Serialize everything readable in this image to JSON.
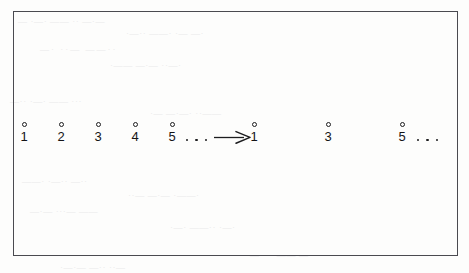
{
  "figure": {
    "type": "number-line-mapping",
    "frame_color": "#4a4a50",
    "ink_color": "#141416",
    "paper_color": "#fdfdfc"
  },
  "left_sequence": {
    "name": "source-sequence",
    "marker": "hollow-circle",
    "labels": [
      "1",
      "2",
      "3",
      "4",
      "5"
    ],
    "trailing_ellipsis_dots": 3
  },
  "arrow": {
    "name": "mapping-arrow",
    "direction": "right",
    "glyph": "arrow-right-icon"
  },
  "right_sequence": {
    "name": "target-sequence",
    "marker": "hollow-circle",
    "labels": [
      "1",
      "3",
      "5"
    ],
    "trailing_ellipsis_dots": 3
  },
  "bleed_through": {
    "note": "illegible show-through text from the reverse page",
    "lines": [
      "— ·—· —— ·· —·—",
      "·—·· ——· ·— —·",
      "—· ··— ——··",
      "·—— —·— ··—·",
      "—·· ·—· —— ···",
      "·— —·—· ··——",
      "——· ·—·· —··",
      "··— —·— ·——·",
      "—·— ···— ——",
      "·—· ——·· ·—·",
      "—··· ·—— —·",
      "·—·— —·· ··—"
    ]
  }
}
